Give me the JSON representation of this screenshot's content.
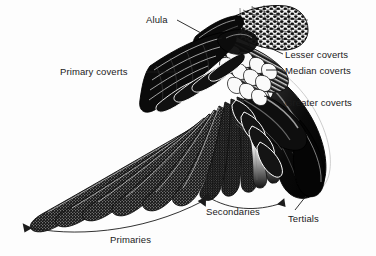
{
  "figure": {
    "kind": "anatomical-illustration",
    "style": "black-and-white stipple engraving",
    "background_color": "#fdfdfd",
    "ink_color": "#101010",
    "width": 376,
    "height": 256
  },
  "labels": {
    "alula": "Alula",
    "primary_coverts": "Primary coverts",
    "lesser_coverts": "Lesser coverts",
    "median_coverts": "Median coverts",
    "greater_coverts": "Greater coverts",
    "secondaries": "Secondaries",
    "tertials": "Tertials",
    "primaries": "Primaries"
  },
  "regions": [
    {
      "name": "alula",
      "label": "Alula",
      "position": "upper-middle"
    },
    {
      "name": "primary-coverts",
      "label": "Primary coverts",
      "position": "mid-left-upper"
    },
    {
      "name": "lesser-coverts",
      "label": "Lesser coverts",
      "position": "upper-right"
    },
    {
      "name": "median-coverts",
      "label": "Median coverts",
      "position": "upper-right"
    },
    {
      "name": "greater-coverts",
      "label": "Greater coverts",
      "position": "right"
    },
    {
      "name": "primaries",
      "label": "Primaries",
      "position": "lower-left"
    },
    {
      "name": "secondaries",
      "label": "Secondaries",
      "position": "lower-middle"
    },
    {
      "name": "tertials",
      "label": "Tertials",
      "position": "lower-right"
    }
  ],
  "leader_lines": [
    {
      "for": "Alula",
      "type": "line"
    },
    {
      "for": "Primary coverts",
      "type": "line"
    },
    {
      "for": "Lesser coverts",
      "type": "line"
    },
    {
      "for": "Median coverts",
      "type": "line"
    },
    {
      "for": "Greater coverts",
      "type": "line"
    },
    {
      "for": "Tertials",
      "type": "line"
    },
    {
      "for": "Primaries",
      "type": "bracket-arc-double-arrow"
    },
    {
      "for": "Secondaries",
      "type": "bracket-arc-double-arrow"
    }
  ]
}
